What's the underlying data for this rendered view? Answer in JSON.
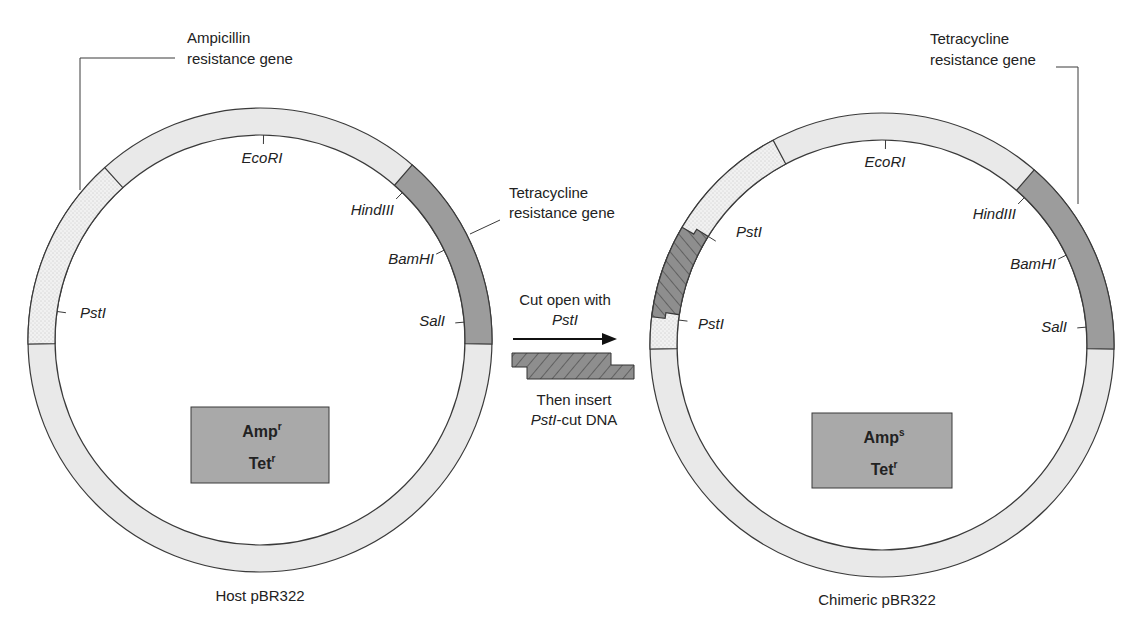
{
  "colors": {
    "ring_light": "#e9e9e9",
    "stipple_bg": "#f1f1f1",
    "stipple_dot": "#9a9a9a",
    "tet_gene": "#9c9c9c",
    "insert_fill": "#8e8e8e",
    "box_fill": "#a9a9a9",
    "stroke": "#3a3a3a",
    "text": "#222222"
  },
  "host": {
    "caption": "Host pBR322",
    "center": [
      260,
      340
    ],
    "r_outer": 232,
    "r_inner": 205,
    "amp_label_line1": "Ampicillin",
    "amp_label_line2": "resistance gene",
    "tet_label_line1": "Tetracycline",
    "tet_label_line2": "resistance gene",
    "amp_arc_deg": [
      132,
      181
    ],
    "tet_arc_deg": [
      -1,
      49
    ],
    "sites": [
      {
        "name": "EcoRI",
        "angle": 89,
        "lx": 262,
        "ly": 163,
        "anchor": "middle"
      },
      {
        "name": "HindIII",
        "angle": 46,
        "lx": 394,
        "ly": 215,
        "anchor": "end"
      },
      {
        "name": "BamHI",
        "angle": 26,
        "lx": 434,
        "ly": 264,
        "anchor": "end"
      },
      {
        "name": "SalI",
        "angle": 5,
        "lx": 445,
        "ly": 326,
        "anchor": "end"
      },
      {
        "name": "PstI",
        "angle": 172,
        "lx": 80,
        "ly": 318,
        "anchor": "start"
      }
    ],
    "box": {
      "x": 191,
      "y": 407,
      "w": 138,
      "h": 76,
      "line1": "Amp",
      "line1_sup": "r",
      "line2": "Tet",
      "line2_sup": "r"
    }
  },
  "chimeric": {
    "caption": "Chimeric pBR322",
    "center": [
      882,
      345
    ],
    "r_outer": 232,
    "r_inner": 205,
    "tet_label_line1": "Tetracycline",
    "tet_label_line2": "resistance gene",
    "stipple_arc_deg": [
      118,
      181
    ],
    "insert_arc_deg": [
      148,
      173
    ],
    "tet_arc_deg": [
      -1,
      49
    ],
    "sites": [
      {
        "name": "EcoRI",
        "angle": 89,
        "lx": 885,
        "ly": 167,
        "anchor": "middle"
      },
      {
        "name": "HindIII",
        "angle": 46,
        "lx": 1016,
        "ly": 219,
        "anchor": "end"
      },
      {
        "name": "BamHI",
        "angle": 26,
        "lx": 1056,
        "ly": 269,
        "anchor": "end"
      },
      {
        "name": "SalI",
        "angle": 5,
        "lx": 1067,
        "ly": 332,
        "anchor": "end"
      },
      {
        "name": "PstI",
        "angle": 148,
        "lx": 736,
        "ly": 237,
        "anchor": "start"
      },
      {
        "name": "PstI",
        "angle": 173,
        "lx": 698,
        "ly": 329,
        "anchor": "start"
      }
    ],
    "box": {
      "x": 812,
      "y": 413,
      "w": 140,
      "h": 75,
      "line1": "Amp",
      "line1_sup": "s",
      "line2": "Tet",
      "line2_sup": "r"
    }
  },
  "middle": {
    "step1_line1": "Cut open with",
    "step1_line2": "PstI",
    "step2_line1": "Then insert",
    "step2_italic": "PstI",
    "step2_rest": "-cut DNA",
    "arrow": {
      "x1": 513,
      "x2": 617,
      "y": 339
    }
  }
}
